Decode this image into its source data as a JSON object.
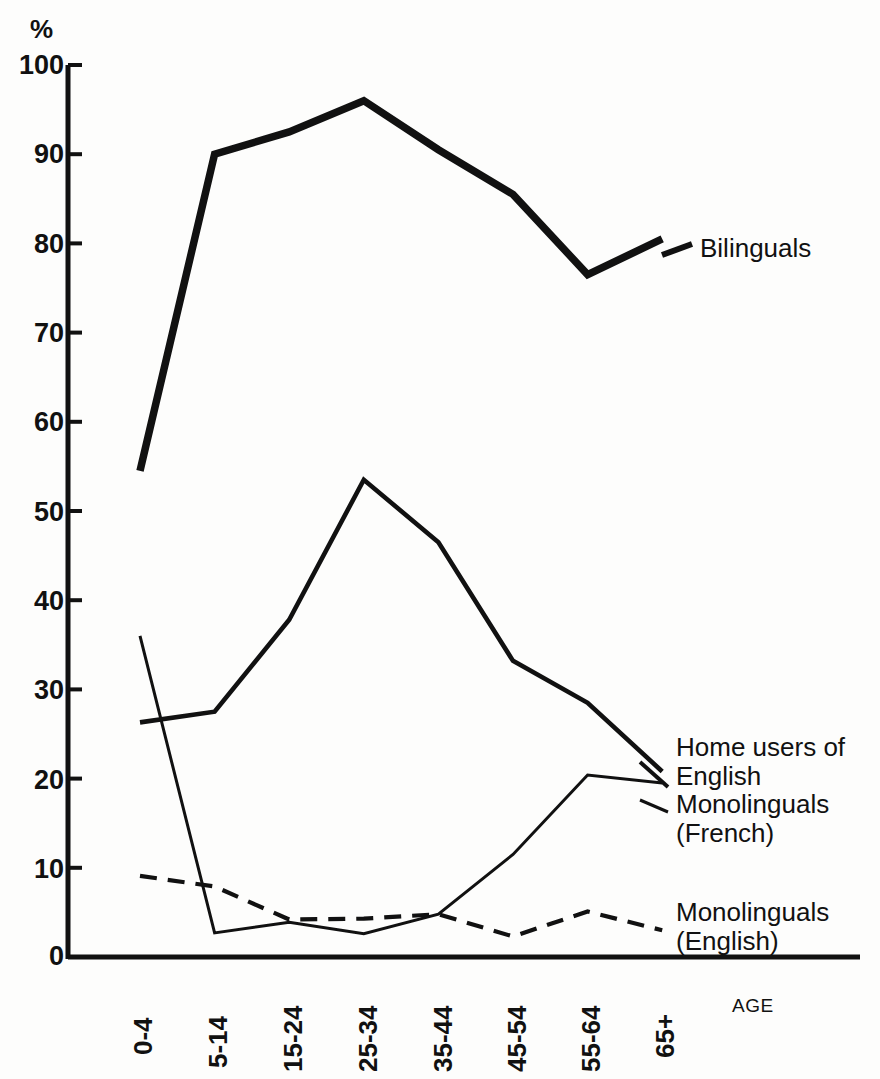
{
  "chart_data": {
    "type": "line",
    "title": "",
    "subtitle": "",
    "xlabel": "AGE",
    "ylabel": "%",
    "categories": [
      "0-4",
      "5-14",
      "15-24",
      "25-34",
      "35-44",
      "45-54",
      "55-64",
      "65+"
    ],
    "ylim": [
      0,
      100
    ],
    "ytick_labels": [
      "0",
      "10",
      "20",
      "30",
      "40",
      "50",
      "60",
      "70",
      "80",
      "90",
      "100"
    ],
    "ytick_values": [
      0,
      10,
      20,
      30,
      40,
      50,
      60,
      70,
      80,
      90,
      100
    ],
    "grid": false,
    "legend_position": "right-inline-annotations",
    "series": [
      {
        "name": "Bilinguals",
        "style": "solid-thick",
        "values": [
          54.5,
          90.0,
          92.5,
          96.0,
          90.5,
          85.5,
          76.5,
          80.5
        ]
      },
      {
        "name": "Home users of English",
        "style": "solid-medium",
        "values": [
          26.3,
          27.5,
          37.8,
          53.5,
          46.5,
          33.2,
          28.5,
          20.8
        ]
      },
      {
        "name": "Monolinguals (French)",
        "style": "solid-thin",
        "values": [
          36.0,
          2.7,
          3.9,
          2.6,
          4.8,
          11.5,
          20.4,
          19.5
        ]
      },
      {
        "name": "Monolinguals (English)",
        "style": "dashed",
        "values": [
          9.1,
          7.9,
          4.2,
          4.3,
          4.8,
          2.3,
          5.1,
          3.0
        ]
      }
    ],
    "annotations": [
      {
        "text": "Bilinguals",
        "series": "Bilinguals"
      },
      {
        "text": "Home users of\nEnglish",
        "series": "Home users of English"
      },
      {
        "text": "Monolinguals\n(French)",
        "series": "Monolinguals (French)"
      },
      {
        "text": "Monolinguals\n(English)",
        "series": "Monolinguals (English)"
      }
    ],
    "colors": {
      "ink": "#111111",
      "background": "#fdfdfc"
    }
  },
  "axis": {
    "y_unit": "%",
    "x_axis_caption": "AGE"
  },
  "ytick_0": "0",
  "ytick_10": "10",
  "ytick_20": "20",
  "ytick_30": "30",
  "ytick_40": "40",
  "ytick_50": "50",
  "ytick_60": "60",
  "ytick_70": "70",
  "ytick_80": "80",
  "ytick_90": "90",
  "ytick_100": "100",
  "xtick_0": "0-4",
  "xtick_1": "5-14",
  "xtick_2": "15-24",
  "xtick_3": "25-34",
  "xtick_4": "35-44",
  "xtick_5": "45-54",
  "xtick_6": "55-64",
  "xtick_7": "65+",
  "label_bilinguals": "Bilinguals",
  "label_home_users": "Home users of\nEnglish",
  "label_mono_french": "Monolinguals\n(French)",
  "label_mono_english": "Monolinguals\n(English)"
}
